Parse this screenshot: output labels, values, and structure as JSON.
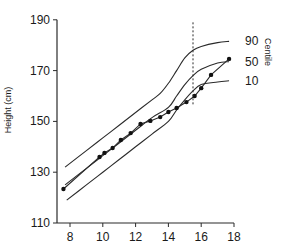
{
  "chart_data": {
    "type": "line",
    "title": "",
    "xlabel": "",
    "ylabel": "Height (cm)",
    "xlim": [
      7.2,
      18
    ],
    "ylim": [
      110,
      190
    ],
    "xticks": [
      8,
      10,
      12,
      14,
      16,
      18
    ],
    "yticks": [
      110,
      130,
      150,
      170,
      190
    ],
    "grid": false,
    "legend": {
      "title": "Centile",
      "position": "right",
      "entries": [
        "90",
        "50",
        "10"
      ]
    },
    "series": [
      {
        "name": "90",
        "kind": "centile",
        "x": [
          7.7,
          9,
          10,
          11,
          12,
          13,
          13.5,
          14,
          14.5,
          15,
          15.5,
          16,
          17,
          17.7
        ],
        "y": [
          132,
          138.5,
          143.5,
          148.5,
          153.5,
          158.5,
          161,
          165,
          170,
          175,
          178,
          179.5,
          181,
          181.5
        ]
      },
      {
        "name": "50",
        "kind": "centile",
        "x": [
          7.7,
          9,
          10,
          11,
          12,
          13,
          14,
          14.5,
          15,
          15.5,
          16,
          17,
          17.7
        ],
        "y": [
          125,
          131.5,
          136.5,
          141.5,
          146.5,
          151.5,
          155.5,
          160,
          164.5,
          168,
          170.5,
          173,
          173.5
        ]
      },
      {
        "name": "10",
        "kind": "centile",
        "x": [
          7.8,
          9,
          10,
          11,
          12,
          13,
          14,
          14.5,
          15,
          15.5,
          16,
          17,
          17.7
        ],
        "y": [
          119,
          125,
          130,
          135,
          140,
          145,
          150,
          154.5,
          158.5,
          162,
          164.5,
          165.5,
          166
        ]
      },
      {
        "name": "Patient",
        "kind": "measurements",
        "x": [
          7.6,
          9.8,
          10.1,
          10.6,
          11.1,
          11.7,
          12.3,
          12.9,
          13.5,
          14.0,
          14.5,
          15.1,
          15.6,
          16.0,
          16.6,
          17.7
        ],
        "y": [
          123.4,
          136,
          137.6,
          139.5,
          142.7,
          145.4,
          149,
          150.2,
          151.7,
          153.7,
          155.3,
          157.6,
          160,
          163.1,
          168.3,
          174.6
        ]
      }
    ],
    "annotations": [
      {
        "type": "vertical-dashed-line",
        "x": 15.5,
        "y_from": 156,
        "y_to": 189
      }
    ]
  },
  "labels": {
    "ylabel": "Height (cm)",
    "legend_title": "Centile"
  }
}
